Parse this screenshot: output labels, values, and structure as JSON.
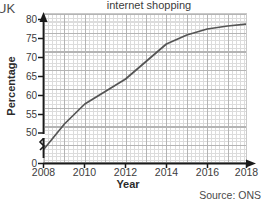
{
  "corner_label": "UK",
  "source_note": "Source: ONS",
  "chart_data": {
    "type": "line",
    "title": "internet shopping",
    "xlabel": "Year",
    "ylabel": "Percentage",
    "x": [
      2008,
      2009,
      2010,
      2011,
      2012,
      2013,
      2014,
      2015,
      2016,
      2017,
      2018
    ],
    "values": [
      53,
      58,
      62,
      64.5,
      67,
      70.5,
      74,
      75.8,
      77,
      77.6,
      78
    ],
    "series": [
      {
        "name": "Percentage of adults who bought goods or services online",
        "values": [
          53,
          58,
          62,
          64.5,
          67,
          70.5,
          74,
          75.8,
          77,
          77.6,
          78
        ]
      }
    ],
    "xlim": [
      2008,
      2018
    ],
    "ylim": [
      50,
      80
    ],
    "xticks": [
      "2008",
      "2010",
      "2012",
      "2014",
      "2016",
      "2018"
    ],
    "yticks": [
      "0",
      "50",
      "55",
      "60",
      "65",
      "70",
      "75",
      "80"
    ],
    "y_axis_break": true,
    "y_break_between": [
      0,
      50
    ],
    "grid": true,
    "legend": "none",
    "line_color": "#555555",
    "grid_color": "#dcdcdc",
    "axis_color": "#1a1a1a"
  }
}
